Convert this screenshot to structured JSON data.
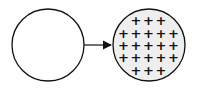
{
  "diagram": {
    "nodes": [
      {
        "id": "empty-circle",
        "label": "",
        "fill": "#ffffff",
        "cx": 48,
        "cy": 45,
        "r": 36
      },
      {
        "id": "charged-circle",
        "label": "",
        "fill": "#eeeeee",
        "cx": 149,
        "cy": 45,
        "r": 36
      }
    ],
    "edge": {
      "from": "empty-circle",
      "to": "charged-circle",
      "type": "arrow"
    },
    "charge_symbol": "+",
    "charge_rows": [
      3,
      5,
      5,
      5,
      3
    ],
    "stroke_color": "#111111"
  }
}
